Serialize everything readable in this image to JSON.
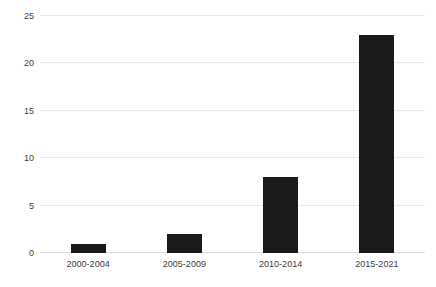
{
  "chart_data": {
    "type": "bar",
    "title": "",
    "subtitle": "",
    "xlabel": "",
    "ylabel": "",
    "categories": [
      "2000-2004",
      "2005-2009",
      "2010-2014",
      "2015-2021"
    ],
    "values": [
      1,
      2,
      8,
      23
    ],
    "series": [
      {
        "name": "",
        "values": [
          1,
          2,
          8,
          23
        ]
      }
    ],
    "ylim": [
      0,
      25
    ],
    "yticks": [
      0,
      5,
      10,
      15,
      20,
      25
    ],
    "ytick_labels": [
      "0",
      "5",
      "10",
      "15",
      "20",
      "25"
    ],
    "grid": "horizontal",
    "legend": "none",
    "bar_color": "#1a1a1a",
    "gridline_color": "#e8e8e8",
    "background_color": "#ffffff",
    "text_color": "#3c3c3c"
  },
  "axis": {
    "y_labels": [
      "25",
      "20",
      "15",
      "10",
      "5",
      "0"
    ],
    "x_labels": [
      "2000-2004",
      "2005-2009",
      "2010-2014",
      "2015-2021"
    ]
  }
}
